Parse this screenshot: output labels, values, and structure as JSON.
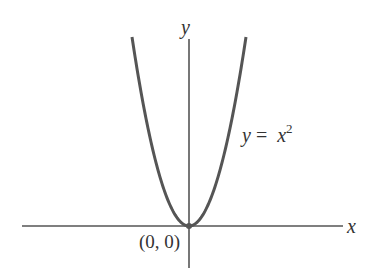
{
  "figure": {
    "axis_labels": {
      "x": "x",
      "y": "y"
    },
    "origin_label": "(0, 0)",
    "curve_label": {
      "lhs": "y",
      "eq": "=",
      "base": "x",
      "exp": "2"
    },
    "colors": {
      "axis": "#555555",
      "curve": "#555555",
      "text": "#333333",
      "background": "#ffffff"
    }
  },
  "chart_data": {
    "type": "line",
    "title": "",
    "function": "y = x^2",
    "xlabel": "x",
    "ylabel": "y",
    "annotations": [
      {
        "text": "(0, 0)",
        "at": [
          0,
          0
        ]
      },
      {
        "text": "y = x^2",
        "position": "right of curve"
      }
    ],
    "marked_points": [
      [
        0,
        0
      ]
    ],
    "grid": false,
    "ticks": false,
    "pixel_geometry": {
      "origin": [
        189,
        226
      ],
      "x_axis": [
        22,
        343
      ],
      "y_axis": [
        39,
        268
      ],
      "curve_top_y": 37,
      "curve_half_width": 57
    }
  }
}
